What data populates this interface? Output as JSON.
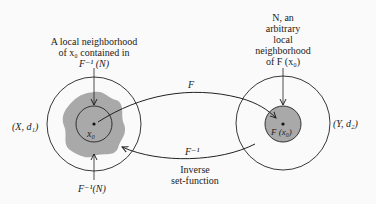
{
  "diagram": {
    "left_space": {
      "label": "(X, d₁)",
      "neighborhood_label_lines": [
        "A local neighborhood",
        "of x₀ contained in",
        "F⁻¹ (N)"
      ],
      "point_label": "x₀",
      "preimage_label": "F⁻¹(N)"
    },
    "right_space": {
      "label": "(Y, d₂)",
      "neighborhood_label_lines": [
        "N, an",
        "arbitrary",
        "local",
        "neighborhood",
        "of F (x₀)"
      ],
      "point_label": "F (x₀)"
    },
    "forward_map": {
      "label": "F"
    },
    "inverse_map": {
      "label": "F⁻¹",
      "caption_lines": [
        "Inverse",
        "set-function"
      ]
    },
    "colors": {
      "stroke": "#222222",
      "shaded_region": "#a9a9a9",
      "background": "#fafafa"
    }
  }
}
